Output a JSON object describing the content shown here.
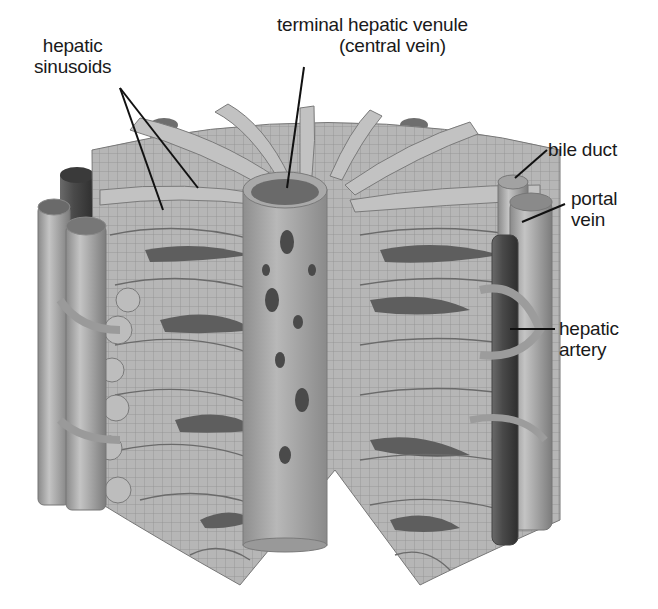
{
  "figure": {
    "colors": {
      "background": "#ffffff",
      "plate_fill": "#b4b4b4",
      "plate_light": "#c8c8c8",
      "plate_grid": "#8a8a8a",
      "sinusoid_dark": "#5c5c5c",
      "central_vein": "#a6a6a6",
      "portal_vein": "#a8a8a8",
      "hepatic_artery": "#505050",
      "bile_duct": "#bdbdbd",
      "leader_line": "#111111",
      "label_text": "#1a1a1a"
    }
  },
  "labels": {
    "hepatic_sinusoids": {
      "line1": "hepatic",
      "line2": "sinusoids"
    },
    "central_vein": {
      "line1": "terminal hepatic venule",
      "line2": "(central vein)"
    },
    "bile_duct": {
      "line1": "bile duct"
    },
    "portal_vein": {
      "line1": "portal",
      "line2": "vein"
    },
    "hepatic_artery": {
      "line1": "hepatic",
      "line2": "artery"
    }
  }
}
